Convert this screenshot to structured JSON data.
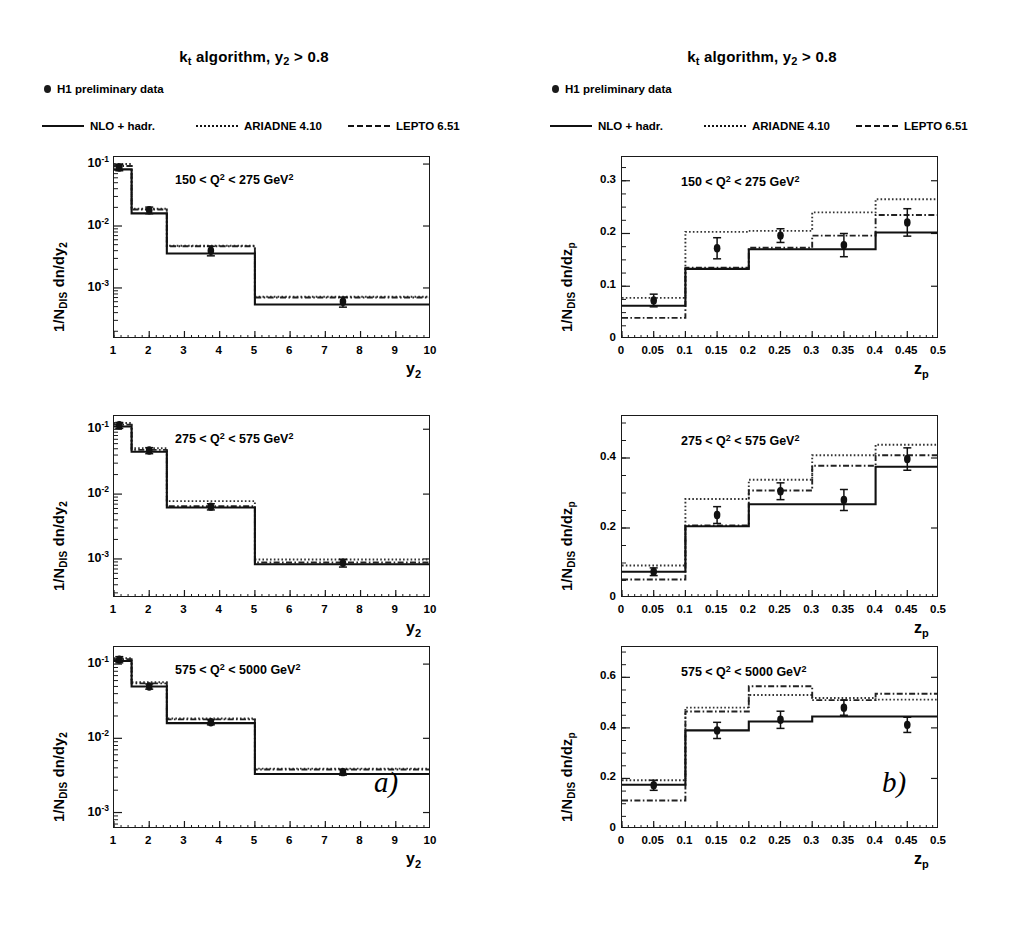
{
  "figure": {
    "columns": [
      {
        "id": "a",
        "title_main": "algorithm, y",
        "title_prefix_k": "k",
        "title_k_sub": "t",
        "title_y_sub": "2",
        "title_tail": "> 0.8",
        "panel_label": "a)",
        "xlabel_base": "y",
        "xlabel_sub": "2",
        "ylabel_pre": "1/N",
        "ylabel_sub": "DIS",
        "ylabel_post": "dn/dy",
        "ylabel_post_sub": "2"
      },
      {
        "id": "b",
        "title_main": "algorithm, y",
        "title_prefix_k": "k",
        "title_k_sub": "t",
        "title_y_sub": "2",
        "title_tail": "> 0.8",
        "panel_label": "b)",
        "xlabel_base": "z",
        "xlabel_sub": "p",
        "ylabel_pre": "1/N",
        "ylabel_sub": "DIS",
        "ylabel_post": "dn/dz",
        "ylabel_post_sub": "p"
      }
    ],
    "legend": {
      "data_label": "H1 preliminary data",
      "entries": [
        {
          "label": "NLO + hadr.",
          "style": "solid"
        },
        {
          "label": "ARIADNE 4.10",
          "style": "dotted"
        },
        {
          "label": "LEPTO 6.51",
          "style": "dash-dot"
        }
      ]
    }
  },
  "chart_data": [
    {
      "panel": "a-top",
      "type": "bar",
      "title": "150 < Q2 < 275 GeV2",
      "q2_label_parts": {
        "low": "150",
        "mid": "< Q",
        "sup": "2",
        "high": "< 275 GeV",
        "sup2": "2"
      },
      "xlabel": "y_2",
      "ylabel": "1/N_DIS dn/dy_2",
      "xlim": [
        1,
        10
      ],
      "ylim_log": [
        0.00015,
        0.13
      ],
      "yscale": "log",
      "ytick_labels": [
        "10",
        "10",
        "10"
      ],
      "ytick_exponents": [
        "-1",
        "-2",
        "-3"
      ],
      "ytick_values": [
        0.1,
        0.01,
        0.001
      ],
      "xtick_labels": [
        "1",
        "2",
        "3",
        "4",
        "5",
        "6",
        "7",
        "8",
        "9",
        "10"
      ],
      "grid": false,
      "bin_edges": [
        1,
        1.5,
        2.5,
        5,
        10
      ],
      "series": [
        {
          "name": "NLO + hadr.",
          "style": "solid",
          "values": [
            0.082,
            0.016,
            0.0036,
            0.00054
          ]
        },
        {
          "name": "ARIADNE 4.10",
          "style": "dotted",
          "values": [
            0.1,
            0.019,
            0.0048,
            0.00072
          ]
        },
        {
          "name": "LEPTO 6.51",
          "style": "dash-dot",
          "values": [
            0.093,
            0.0185,
            0.0047,
            0.0007
          ]
        }
      ],
      "data_points": {
        "x": [
          1.15,
          2.0,
          3.75,
          7.5
        ],
        "y": [
          0.088,
          0.018,
          0.004,
          0.0006
        ],
        "yerr": [
          0.01,
          0.0022,
          0.0007,
          0.00011
        ]
      }
    },
    {
      "panel": "a-middle",
      "type": "bar",
      "title": "275 < Q2 < 575 GeV2",
      "q2_label_parts": {
        "low": "275",
        "mid": "< Q",
        "sup": "2",
        "high": "< 575 GeV",
        "sup2": "2"
      },
      "xlabel": "y_2",
      "ylabel": "1/N_DIS dn/dy_2",
      "xlim": [
        1,
        10
      ],
      "ylim_log": [
        0.00025,
        0.16
      ],
      "yscale": "log",
      "ytick_labels": [
        "10",
        "10",
        "10"
      ],
      "ytick_exponents": [
        "-1",
        "-2",
        "-3"
      ],
      "ytick_values": [
        0.1,
        0.01,
        0.001
      ],
      "xtick_labels": [
        "1",
        "2",
        "3",
        "4",
        "5",
        "6",
        "7",
        "8",
        "9",
        "10"
      ],
      "grid": false,
      "bin_edges": [
        1,
        1.5,
        2.5,
        5,
        10
      ],
      "series": [
        {
          "name": "NLO + hadr.",
          "style": "solid",
          "values": [
            0.11,
            0.045,
            0.0062,
            0.00083
          ]
        },
        {
          "name": "ARIADNE 4.10",
          "style": "dotted",
          "values": [
            0.125,
            0.051,
            0.0078,
            0.00098
          ]
        },
        {
          "name": "LEPTO 6.51",
          "style": "dash-dot",
          "values": [
            0.118,
            0.048,
            0.0065,
            0.00088
          ]
        }
      ],
      "data_points": {
        "x": [
          1.15,
          2.0,
          3.75,
          7.5
        ],
        "y": [
          0.115,
          0.047,
          0.0064,
          0.00087
        ],
        "yerr": [
          0.012,
          0.005,
          0.0007,
          0.00012
        ]
      }
    },
    {
      "panel": "a-bottom",
      "type": "bar",
      "title": "575 < Q2 < 5000 GeV2",
      "q2_label_parts": {
        "low": "575",
        "mid": "< Q",
        "sup": "2",
        "high": "< 5000 GeV",
        "sup2": "2"
      },
      "xlabel": "y_2",
      "ylabel": "1/N_DIS dn/dy_2",
      "xlim": [
        1,
        10
      ],
      "ylim_log": [
        0.0006,
        0.17
      ],
      "yscale": "log",
      "ytick_labels": [
        "10",
        "10",
        "10"
      ],
      "ytick_exponents": [
        "-1",
        "-2",
        "-3"
      ],
      "ytick_values": [
        0.1,
        0.01,
        0.001
      ],
      "xtick_labels": [
        "1",
        "2",
        "3",
        "4",
        "5",
        "6",
        "7",
        "8",
        "9",
        "10"
      ],
      "grid": false,
      "bin_edges": [
        1,
        1.5,
        2.5,
        5,
        10
      ],
      "series": [
        {
          "name": "NLO + hadr.",
          "style": "solid",
          "values": [
            0.11,
            0.05,
            0.016,
            0.0033
          ]
        },
        {
          "name": "ARIADNE 4.10",
          "style": "dotted",
          "values": [
            0.12,
            0.057,
            0.0185,
            0.0039
          ]
        },
        {
          "name": "LEPTO 6.51",
          "style": "dash-dot",
          "values": [
            0.116,
            0.055,
            0.018,
            0.0038
          ]
        }
      ],
      "data_points": {
        "x": [
          1.15,
          2.0,
          3.75,
          7.5
        ],
        "y": [
          0.115,
          0.05,
          0.0165,
          0.0035
        ],
        "yerr": [
          0.011,
          0.004,
          0.0013,
          0.0003
        ]
      }
    },
    {
      "panel": "b-top",
      "type": "bar",
      "title": "150 < Q2 < 275 GeV2",
      "q2_label_parts": {
        "low": "150",
        "mid": "< Q",
        "sup": "2",
        "high": "< 275 GeV",
        "sup2": "2"
      },
      "xlabel": "z_p",
      "ylabel": "1/N_DIS dn/dz_p",
      "xlim": [
        0,
        0.5
      ],
      "ylim": [
        0,
        0.345
      ],
      "yscale": "linear",
      "ytick_labels": [
        "0",
        "0.1",
        "0.2",
        "0.3"
      ],
      "ytick_values": [
        0,
        0.1,
        0.2,
        0.3
      ],
      "xtick_labels": [
        "0",
        "0.05",
        "0.1",
        "0.15",
        "0.2",
        "0.25",
        "0.3",
        "0.35",
        "0.4",
        "0.45",
        "0.5"
      ],
      "grid": false,
      "bin_edges": [
        0,
        0.1,
        0.2,
        0.3,
        0.4,
        0.5
      ],
      "series": [
        {
          "name": "NLO + hadr.",
          "style": "solid",
          "values": [
            0.063,
            0.133,
            0.17,
            0.17,
            0.202
          ]
        },
        {
          "name": "ARIADNE 4.10",
          "style": "dotted",
          "values": [
            0.078,
            0.203,
            0.205,
            0.24,
            0.265
          ]
        },
        {
          "name": "LEPTO 6.51",
          "style": "dash-dot",
          "values": [
            0.04,
            0.135,
            0.173,
            0.196,
            0.235
          ]
        }
      ],
      "data_points": {
        "x": [
          0.05,
          0.15,
          0.25,
          0.35,
          0.45
        ],
        "y": [
          0.073,
          0.172,
          0.196,
          0.178,
          0.221
        ],
        "yerr": [
          0.012,
          0.02,
          0.013,
          0.022,
          0.026
        ]
      }
    },
    {
      "panel": "b-middle",
      "type": "bar",
      "title": "275 < Q2 < 575 GeV2",
      "q2_label_parts": {
        "low": "275",
        "mid": "< Q",
        "sup": "2",
        "high": "< 575 GeV",
        "sup2": "2"
      },
      "xlabel": "z_p",
      "ylabel": "1/N_DIS dn/dz_p",
      "xlim": [
        0,
        0.5
      ],
      "ylim": [
        0,
        0.52
      ],
      "yscale": "linear",
      "ytick_labels": [
        "0",
        "0.2",
        "0.4"
      ],
      "ytick_values": [
        0,
        0.2,
        0.4
      ],
      "xtick_labels": [
        "0",
        "0.05",
        "0.1",
        "0.15",
        "0.2",
        "0.25",
        "0.3",
        "0.35",
        "0.4",
        "0.45",
        "0.5"
      ],
      "grid": false,
      "bin_edges": [
        0,
        0.1,
        0.2,
        0.3,
        0.4,
        0.5
      ],
      "series": [
        {
          "name": "NLO + hadr.",
          "style": "solid",
          "values": [
            0.075,
            0.205,
            0.268,
            0.268,
            0.375
          ]
        },
        {
          "name": "ARIADNE 4.10",
          "style": "dotted",
          "values": [
            0.093,
            0.283,
            0.338,
            0.408,
            0.438
          ]
        },
        {
          "name": "LEPTO 6.51",
          "style": "dash-dot",
          "values": [
            0.053,
            0.207,
            0.307,
            0.378,
            0.408
          ]
        }
      ],
      "data_points": {
        "x": [
          0.05,
          0.15,
          0.25,
          0.35,
          0.45
        ],
        "y": [
          0.075,
          0.237,
          0.305,
          0.28,
          0.397
        ],
        "yerr": [
          0.011,
          0.024,
          0.024,
          0.03,
          0.032
        ]
      }
    },
    {
      "panel": "b-bottom",
      "type": "bar",
      "title": "575 < Q2 < 5000 GeV2",
      "q2_label_parts": {
        "low": "575",
        "mid": "< Q",
        "sup": "2",
        "high": "< 5000 GeV",
        "sup2": "2"
      },
      "xlabel": "z_p",
      "ylabel": "1/N_DIS dn/dz_p",
      "xlim": [
        0,
        0.5
      ],
      "ylim": [
        0,
        0.72
      ],
      "yscale": "linear",
      "ytick_labels": [
        "0",
        "0.2",
        "0.4",
        "0.6"
      ],
      "ytick_values": [
        0,
        0.2,
        0.4,
        0.6
      ],
      "xtick_labels": [
        "0",
        "0.05",
        "0.1",
        "0.15",
        "0.2",
        "0.25",
        "0.3",
        "0.35",
        "0.4",
        "0.45",
        "0.5"
      ],
      "grid": false,
      "bin_edges": [
        0,
        0.1,
        0.2,
        0.3,
        0.4,
        0.5
      ],
      "series": [
        {
          "name": "NLO + hadr.",
          "style": "solid",
          "values": [
            0.175,
            0.39,
            0.425,
            0.445,
            0.445
          ]
        },
        {
          "name": "ARIADNE 4.10",
          "style": "dotted",
          "values": [
            0.193,
            0.48,
            0.53,
            0.518,
            0.512
          ]
        },
        {
          "name": "LEPTO 6.51",
          "style": "dash-dot",
          "values": [
            0.113,
            0.465,
            0.565,
            0.51,
            0.535
          ]
        }
      ],
      "data_points": {
        "x": [
          0.05,
          0.15,
          0.25,
          0.35,
          0.45
        ],
        "y": [
          0.173,
          0.39,
          0.432,
          0.48,
          0.412
        ]
      },
      "yerr_note": ""
    }
  ],
  "errors_b_bottom": {
    "yerr": [
      0.02,
      0.032,
      0.034,
      0.03,
      0.03
    ]
  }
}
